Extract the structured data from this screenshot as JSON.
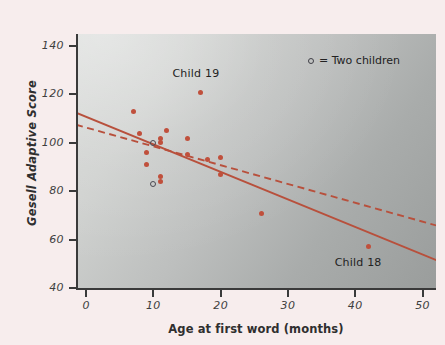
{
  "chart_data": {
    "type": "scatter",
    "title": "",
    "xlabel": "Age at first word (months)",
    "ylabel": "Gesell Adaptive Score",
    "xlim": [
      -1.5,
      52
    ],
    "ylim": [
      40,
      145
    ],
    "xticks": [
      0,
      10,
      20,
      30,
      40,
      50
    ],
    "yticks": [
      40,
      60,
      80,
      100,
      120,
      140
    ],
    "grid": false,
    "legend_position": "top-right",
    "legend_entries": [
      {
        "marker": "open-circle",
        "label": "= Two children"
      }
    ],
    "points": [
      {
        "x": 15,
        "y": 95
      },
      {
        "x": 26,
        "y": 71
      },
      {
        "x": 10,
        "y": 83,
        "note": "two children (open circle)"
      },
      {
        "x": 9,
        "y": 91
      },
      {
        "x": 15,
        "y": 102
      },
      {
        "x": 20,
        "y": 87
      },
      {
        "x": 18,
        "y": 93
      },
      {
        "x": 11,
        "y": 100
      },
      {
        "x": 8,
        "y": 104
      },
      {
        "x": 20,
        "y": 94
      },
      {
        "x": 7,
        "y": 113
      },
      {
        "x": 9,
        "y": 96
      },
      {
        "x": 10,
        "y": 83
      },
      {
        "x": 11,
        "y": 84
      },
      {
        "x": 11,
        "y": 102
      },
      {
        "x": 10,
        "y": 100,
        "note": "two children (open circle)"
      },
      {
        "x": 12,
        "y": 105
      },
      {
        "x": 42,
        "y": 57,
        "label": "Child 18"
      },
      {
        "x": 17,
        "y": 121,
        "label": "Child 19"
      },
      {
        "x": 11,
        "y": 86
      },
      {
        "x": 10,
        "y": 100
      }
    ],
    "annotations": [
      {
        "text": "Child 19",
        "x": 17,
        "y": 128
      },
      {
        "text": "Child 18",
        "x": 42,
        "y": 50
      }
    ],
    "lines": [
      {
        "name": "regression-all-points",
        "style": "solid",
        "color": "#b8503c",
        "x0": -1.5,
        "y0": 112.5,
        "x1": 52.5,
        "y1": 51
      },
      {
        "name": "regression-excluding-children-18-19",
        "style": "dashed",
        "color": "#b8503c",
        "x0": -1.5,
        "y0": 107.5,
        "x1": 52.5,
        "y1": 65.5
      }
    ]
  },
  "axes": {
    "y_title": "Gesell Adaptive Score",
    "x_title": "Age at first word (months)",
    "y_tick_labels": [
      "140",
      "120",
      "100",
      "80",
      "60",
      "40"
    ],
    "x_tick_labels": [
      "0",
      "10",
      "20",
      "30",
      "40",
      "50"
    ]
  },
  "legend": {
    "marker_name": "open-circle-marker",
    "text": "= Two children"
  },
  "annotations": {
    "child19": "Child 19",
    "child18": "Child 18"
  },
  "colors": {
    "point": "#c0503c",
    "line": "#b8503c",
    "open_marker": "#4a4a52",
    "axis": "#3a3a3a",
    "background": "#f7eded"
  }
}
